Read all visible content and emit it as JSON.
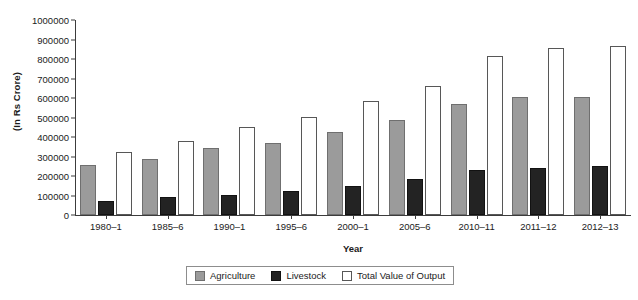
{
  "chart_data": {
    "type": "bar",
    "title": "",
    "xlabel": "Year",
    "ylabel": "(In Rs Crore)",
    "ylim": [
      0,
      1000000
    ],
    "ytick_step": 100000,
    "grid": false,
    "legend_position": "bottom",
    "categories": [
      "1980–1",
      "1985–6",
      "1990–1",
      "1995–6",
      "2000–1",
      "2005–6",
      "2010–11",
      "2011–12",
      "2012–13"
    ],
    "yticks": [
      "0",
      "100000",
      "200000",
      "300000",
      "400000",
      "500000",
      "600000",
      "700000",
      "800000",
      "900000",
      "1000000"
    ],
    "series": [
      {
        "name": "Agriculture",
        "color": "#9b9b9b",
        "values": [
          258000,
          285000,
          343000,
          370000,
          424000,
          485000,
          570000,
          605000,
          605000
        ]
      },
      {
        "name": "Livestock",
        "color": "#232323",
        "values": [
          70000,
          92000,
          105000,
          122000,
          150000,
          185000,
          232000,
          243000,
          250000
        ]
      },
      {
        "name": "Total Value of Output",
        "color": "#ffffff",
        "values": [
          325000,
          380000,
          450000,
          505000,
          583000,
          660000,
          815000,
          855000,
          865000
        ]
      }
    ]
  },
  "legend": {
    "items": [
      {
        "label": "Agriculture"
      },
      {
        "label": "Livestock"
      },
      {
        "label": "Total Value of Output"
      }
    ]
  }
}
